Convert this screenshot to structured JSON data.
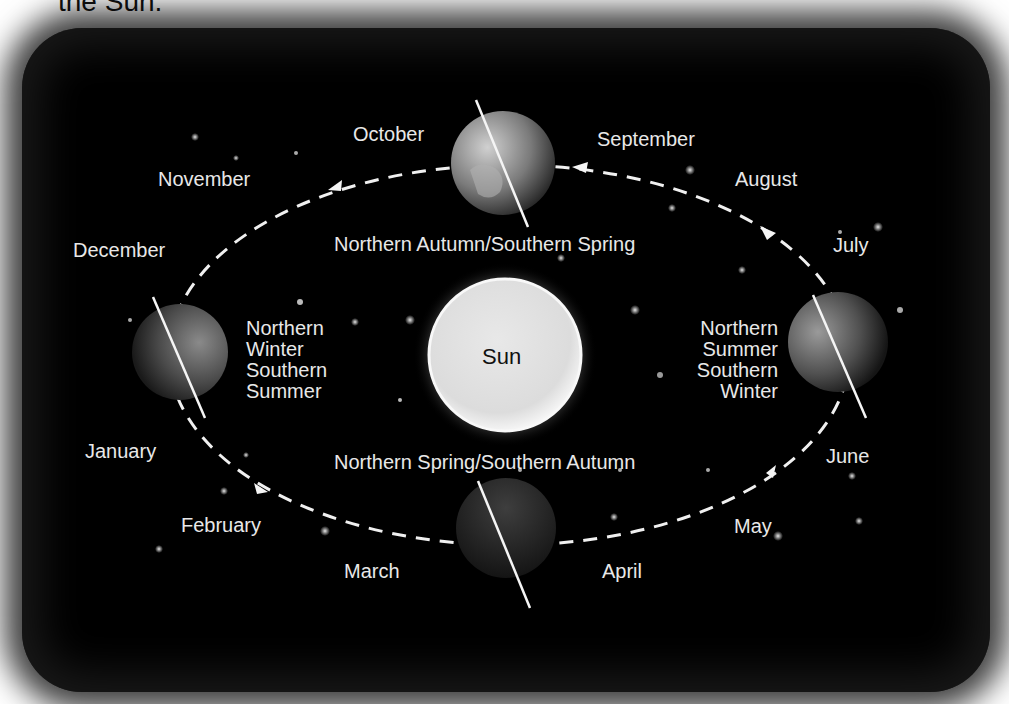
{
  "caption": "the Sun.",
  "diagram": {
    "sun": {
      "label": "Sun"
    },
    "seasons": {
      "top": "Northern Autumn/Southern Spring",
      "bottom": "Northern Spring/Southern Autumn",
      "left": [
        "Northern",
        "Winter",
        "Southern",
        "Summer"
      ],
      "right": [
        "Northern",
        "Summer",
        "Southern",
        "Winter"
      ]
    },
    "months": {
      "october": "October",
      "september": "September",
      "november": "November",
      "august": "August",
      "december": "December",
      "july": "July",
      "january": "January",
      "june": "June",
      "february": "February",
      "may": "May",
      "march": "March",
      "april": "April"
    },
    "colors": {
      "background": "#000000",
      "text": "#e8e8e8",
      "orbit": "#f0f0f0",
      "sun": "#e6e6e6"
    }
  }
}
